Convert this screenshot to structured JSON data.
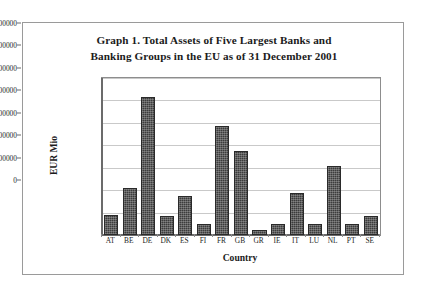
{
  "chart_data": {
    "type": "bar",
    "title": "Graph 1. Total Assets of Five Largest Banks and Banking Groups in the EU as of 31 December 2001",
    "title_lines": [
      "Graph 1. Total Assets of Five Largest Banks and",
      "Banking Groups in the EU as of 31 December 2001"
    ],
    "xlabel": "Country",
    "ylabel": "EUR Mio",
    "ylim": [
      0,
      3500000
    ],
    "ytick_step": 500000,
    "grid": true,
    "legend": false,
    "categories": [
      "AT",
      "BE",
      "DE",
      "DK",
      "ES",
      "FI",
      "FR",
      "GB",
      "GR",
      "IE",
      "IT",
      "LU",
      "NL",
      "PT",
      "SE"
    ],
    "values": [
      450000,
      1050000,
      3080000,
      430000,
      870000,
      250000,
      2440000,
      1870000,
      110000,
      250000,
      940000,
      250000,
      1530000,
      250000,
      430000
    ],
    "ytick_labels": [
      "3500000",
      "3000000",
      "2500000",
      "2000000",
      "1500000",
      "1000000",
      "500000",
      "0"
    ],
    "ytick_values": [
      3500000,
      3000000,
      2500000,
      2000000,
      1500000,
      1000000,
      500000,
      0
    ],
    "bar_color": "#3c3c3c",
    "grid_color": "#c9c9c9",
    "axis_color": "#6b6b6b"
  }
}
